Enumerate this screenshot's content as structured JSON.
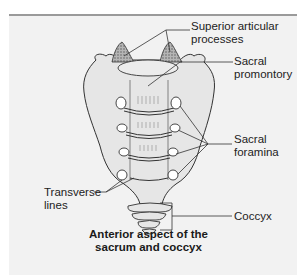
{
  "figure": {
    "caption_line1": "Anterior aspect of the",
    "caption_line2": "sacrum and coccyx",
    "colors": {
      "panel": "#f2f2f2",
      "bone_fill": "#e6e6e6",
      "outline": "#333333",
      "processes": "#9a9a9a",
      "rule": "#9a9a9a"
    }
  },
  "labels": {
    "superior_articular_1": "Superior articular",
    "superior_articular_2": "processes",
    "sacral_promontory_1": "Sacral",
    "sacral_promontory_2": "promontory",
    "sacral_foramina_1": "Sacral",
    "sacral_foramina_2": "foramina",
    "transverse_lines_1": "Transverse",
    "transverse_lines_2": "lines",
    "coccyx": "Coccyx"
  }
}
